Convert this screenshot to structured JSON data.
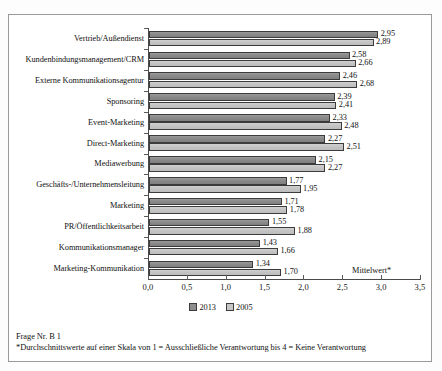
{
  "chart_data": {
    "type": "bar",
    "orientation": "horizontal",
    "title": "",
    "xlabel": "Mittelwert*",
    "ylabel": "",
    "xlim": [
      0.0,
      3.5
    ],
    "xticks": [
      "0,0",
      "0,5",
      "1,0",
      "1,5",
      "2,0",
      "2,5",
      "3,0",
      "3,5"
    ],
    "xtick_values": [
      0.0,
      0.5,
      1.0,
      1.5,
      2.0,
      2.5,
      3.0,
      3.5
    ],
    "grid": false,
    "legend_position": "bottom",
    "categories": [
      "Vertrieb/Außendienst",
      "Kundenbindungsmanagement/CRM",
      "Externe Kommunikationsagentur",
      "Sponsoring",
      "Event-Marketing",
      "Direct-Marketing",
      "Mediawerbung",
      "Geschäfts-/Unternehmensleitung",
      "Marketing",
      "PR/Öffentlichkeitsarbeit",
      "Kommunikationsmanager",
      "Marketing-Kommunikation"
    ],
    "series": [
      {
        "name": "2013",
        "color": "#8d8d8d",
        "values": [
          2.95,
          2.58,
          2.46,
          2.39,
          2.33,
          2.27,
          2.15,
          1.77,
          1.71,
          1.55,
          1.43,
          1.34
        ],
        "labels": [
          "2,95",
          "2,58",
          "2,46",
          "2,39",
          "2,33",
          "2,27",
          "2,15",
          "1,77",
          "1,71",
          "1,55",
          "1,43",
          "1,34"
        ]
      },
      {
        "name": "2005",
        "color": "#c6c6c6",
        "values": [
          2.89,
          2.66,
          2.68,
          2.41,
          2.48,
          2.51,
          2.27,
          1.95,
          1.78,
          1.88,
          1.66,
          1.7
        ],
        "labels": [
          "2,89",
          "2,66",
          "2,68",
          "2,41",
          "2,48",
          "2,51",
          "2,27",
          "1,95",
          "1,78",
          "1,88",
          "1,66",
          "1,70"
        ]
      }
    ],
    "annotations": {
      "axis_caption": "Mittelwert*"
    }
  },
  "legend": {
    "items": [
      {
        "label": "2013",
        "color": "#8d8d8d"
      },
      {
        "label": "2005",
        "color": "#c6c6c6"
      }
    ]
  },
  "footnotes": {
    "line1": "Frage Nr. B 1",
    "line2": "*Durchschnittswerte auf einer Skala von 1 = Ausschließliche Verantwortung bis 4 = Keine Verantwortung"
  }
}
